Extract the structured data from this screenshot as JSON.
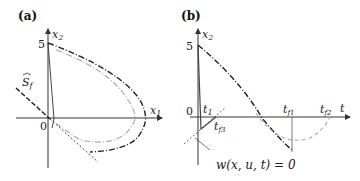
{
  "figure": {
    "panel_a": {
      "label": "(a)",
      "x_axis": "x",
      "x_axis_sub": "1",
      "y_axis": "x",
      "y_axis_sub": "2",
      "tick_5": "5",
      "tick_0": "0",
      "surface_label": "S",
      "surface_sub": "f"
    },
    "panel_b": {
      "label": "(b)",
      "y_axis": "x",
      "y_axis_sub": "2",
      "x_axis": "t",
      "tick_5": "5",
      "tick_0": "0",
      "t1": "t",
      "t1_sub": "1",
      "tf1": "t",
      "tf1_sub": "f1",
      "tf2": "t",
      "tf2_sub": "f2",
      "tf3": "t",
      "tf3_sub": "f3",
      "constraint": "w(x, u, t) = 0"
    },
    "colors": {
      "axis": "#333333",
      "dark_curve": "#222222",
      "light_curve": "#aaaaaa"
    }
  }
}
